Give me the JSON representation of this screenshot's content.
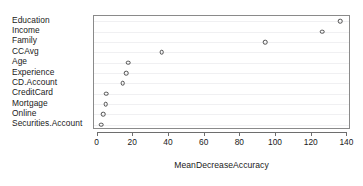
{
  "chart_data": {
    "type": "scatter",
    "title": "",
    "subtitle": "",
    "xlabel": "MeanDecreaseAccuracy",
    "ylabel": "",
    "categories": [
      "Education",
      "Income",
      "Family",
      "CCAvg",
      "Age",
      "Experience",
      "CD.Account",
      "CreditCard",
      "Mortgage",
      "Online",
      "Securities.Account"
    ],
    "values": [
      136,
      126,
      94,
      36,
      17,
      16,
      14,
      5,
      4.5,
      3,
      2
    ],
    "xlim": [
      -2,
      142
    ],
    "xticks": [
      0,
      20,
      40,
      60,
      80,
      100,
      120,
      140
    ],
    "xtick_labels": [
      "0",
      "20",
      "40",
      "60",
      "80",
      "100",
      "120",
      "140"
    ],
    "grid": true,
    "grid_axis": "y",
    "legend": "none",
    "marker": "open-circle",
    "marker_color": "#4d4d4d",
    "frame_color": "#8a8a8a",
    "gridline_color": "#f0f0f2",
    "background": "#ffffff"
  }
}
